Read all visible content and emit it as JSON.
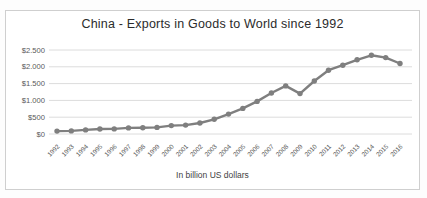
{
  "chart_data": {
    "type": "line",
    "title": "China - Exports in Goods to World since 1992",
    "caption": "In billion US dollars",
    "categories": [
      1992,
      1993,
      1994,
      1995,
      1996,
      1997,
      1998,
      1999,
      2000,
      2001,
      2002,
      2003,
      2004,
      2005,
      2006,
      2007,
      2008,
      2009,
      2010,
      2011,
      2012,
      2013,
      2014,
      2015,
      2016
    ],
    "values": [
      85,
      92,
      121,
      149,
      151,
      183,
      184,
      195,
      249,
      266,
      326,
      438,
      593,
      762,
      969,
      1220,
      1431,
      1202,
      1578,
      1898,
      2049,
      2209,
      2342,
      2273,
      2098
    ],
    "ylim": [
      0,
      2500
    ],
    "yticks": [
      {
        "value": 2500,
        "label": "$2.500"
      },
      {
        "value": 2000,
        "label": "$2.000"
      },
      {
        "value": 1500,
        "label": "$1.500"
      },
      {
        "value": 1000,
        "label": "$1.000"
      },
      {
        "value": 500,
        "label": "$500"
      },
      {
        "value": 0,
        "label": "$0"
      }
    ],
    "grid": true,
    "legend": "none",
    "colors": {
      "line": "#7f7f7f",
      "marker": "#7f7f7f",
      "gridline": "#dcdcdc",
      "axis_text": "#595959",
      "title_text": "#2b2b2b",
      "frame_border": "#cfcfcf"
    }
  }
}
